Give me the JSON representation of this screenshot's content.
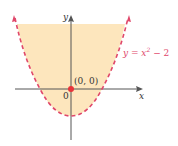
{
  "figure": {
    "equation_label": "y = x",
    "equation_exponent": "2",
    "equation_suffix": " − 2",
    "point_label": "(0, 0)",
    "origin_label": "0",
    "x_axis_label": "x",
    "y_axis_label": "y",
    "colors": {
      "region_fill": "#fde6bd",
      "curve": "#e0476a",
      "point": "#e8343a",
      "axis": "#555555",
      "label": "#333333",
      "equation": "#e0476a"
    }
  }
}
